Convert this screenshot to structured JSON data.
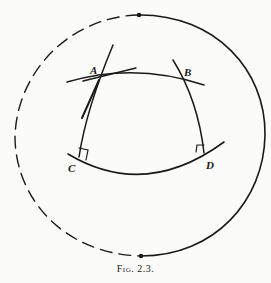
{
  "figure": {
    "caption_prefix": "Fig.",
    "caption_number": "2.3.",
    "points": {
      "A": "A",
      "B": "B",
      "C": "C",
      "D": "D"
    },
    "elements": [
      "outer circle: solid right half, dashed left half, dots at top and bottom",
      "arc through A and B",
      "arc through C and D",
      "line through A and C (with tangent mark at A)",
      "line through B and D",
      "right-angle marks at C and D"
    ],
    "colors": {
      "ink": "#1a1a1a",
      "paper": "#fbfbf9"
    }
  }
}
